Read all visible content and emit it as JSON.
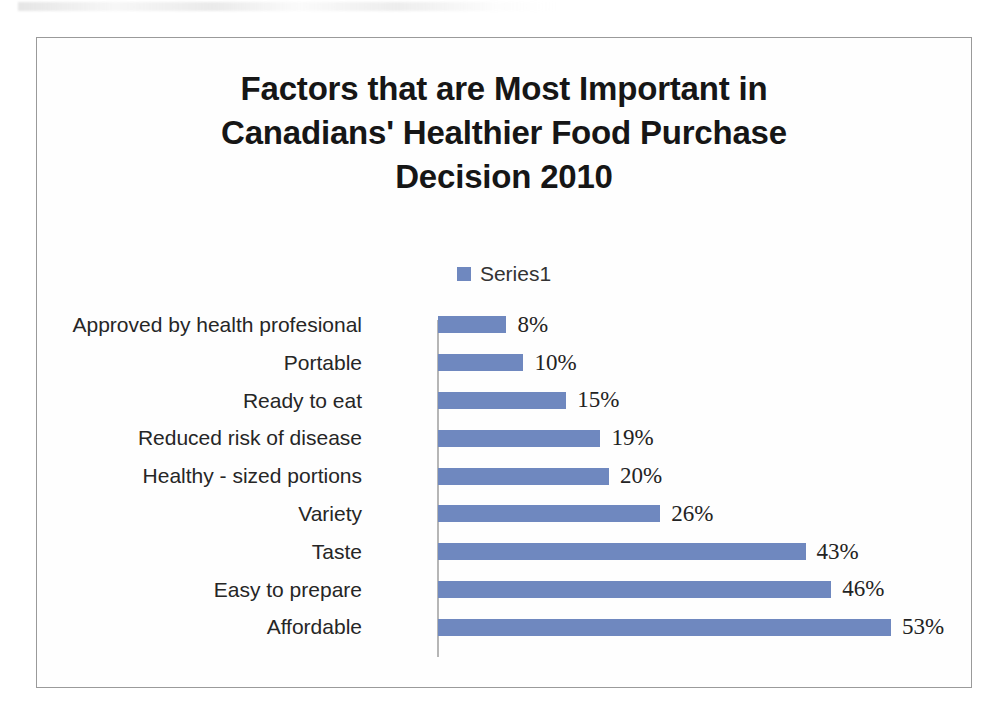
{
  "page": {
    "background_color": "#ffffff",
    "frame_border_color": "#9a9a9a"
  },
  "chart_title_text": "Factors that are Most Important in\nCanadians' Healthier Food Purchase\nDecision 2010",
  "legend": {
    "label": "Series1",
    "swatch_color": "#6f88bf",
    "position": "top-center"
  },
  "chart_data": {
    "type": "bar",
    "orientation": "horizontal",
    "title": "Factors that are Most Important in Canadians' Healthier Food Purchase Decision 2010",
    "xlabel": "",
    "ylabel": "",
    "xlim": [
      0,
      53
    ],
    "grid": false,
    "legend_position": "top-center",
    "series": [
      {
        "name": "Series1",
        "color": "#6f88bf",
        "values": [
          8,
          10,
          15,
          19,
          20,
          26,
          43,
          46,
          53
        ]
      }
    ],
    "categories": [
      "Approved by health profesional",
      "Portable",
      "Ready to eat",
      "Reduced risk of disease",
      "Healthy - sized portions",
      "Variety",
      "Taste",
      "Easy to prepare",
      "Affordable"
    ],
    "value_labels": [
      "8%",
      "10%",
      "15%",
      "19%",
      "20%",
      "26%",
      "43%",
      "46%",
      "53%"
    ],
    "bars": [
      {
        "category": "Approved by health profesional",
        "value": 8,
        "label": "8%"
      },
      {
        "category": "Portable",
        "value": 10,
        "label": "10%"
      },
      {
        "category": "Ready to eat",
        "value": 15,
        "label": "15%"
      },
      {
        "category": "Reduced risk of disease",
        "value": 19,
        "label": "19%"
      },
      {
        "category": "Healthy - sized portions",
        "value": 20,
        "label": "20%"
      },
      {
        "category": "Variety",
        "value": 26,
        "label": "26%"
      },
      {
        "category": "Taste",
        "value": 43,
        "label": "43%"
      },
      {
        "category": "Easy to prepare",
        "value": 46,
        "label": "46%"
      },
      {
        "category": "Affordable",
        "value": 53,
        "label": "53%"
      }
    ]
  }
}
